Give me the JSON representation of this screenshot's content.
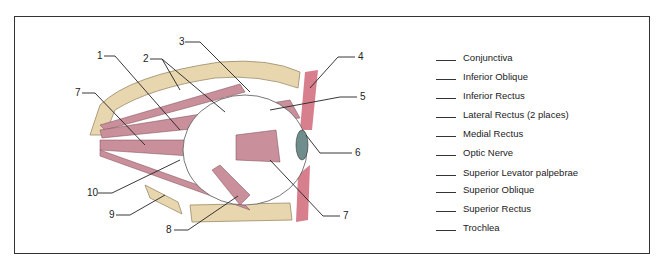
{
  "diagram": {
    "callout_numbers": [
      {
        "n": "1",
        "x": 97,
        "y": 50
      },
      {
        "n": "2",
        "x": 143,
        "y": 53
      },
      {
        "n": "3",
        "x": 179,
        "y": 36
      },
      {
        "n": "4",
        "x": 358,
        "y": 51
      },
      {
        "n": "5",
        "x": 360,
        "y": 91
      },
      {
        "n": "6",
        "x": 355,
        "y": 147
      },
      {
        "n": "7",
        "x": 75,
        "y": 87
      },
      {
        "n": "7",
        "x": 343,
        "y": 210
      },
      {
        "n": "8",
        "x": 166,
        "y": 224
      },
      {
        "n": "9",
        "x": 109,
        "y": 209
      },
      {
        "n": "10",
        "x": 87,
        "y": 187
      }
    ],
    "legend": [
      "Conjunctiva",
      "Inferior Oblique",
      "Inferior Rectus",
      "Lateral Rectus (2 places)",
      "Medial Rectus",
      "Optic Nerve",
      "Superior Levator palpebrae",
      "Superior Oblique",
      "Superior Rectus",
      "Trochlea"
    ],
    "colors": {
      "muscle": "#c98f9a",
      "bone": "#e8d6ae",
      "lid": "#d77f8c",
      "line": "#222222"
    }
  }
}
